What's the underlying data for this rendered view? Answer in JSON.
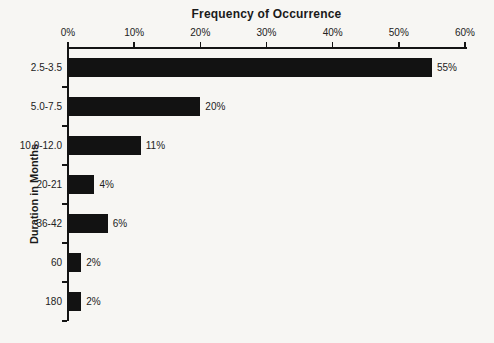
{
  "chart_data": {
    "type": "bar",
    "orientation": "horizontal",
    "title": "Frequency of Occurrence",
    "xlabel": "Frequency of Occurrence",
    "ylabel": "Duration in Months",
    "categories": [
      "2.5-3.5",
      "5.0-7.5",
      "10.0-12.0",
      "20-21",
      "36-42",
      "60",
      "180"
    ],
    "values": [
      55,
      20,
      11,
      4,
      6,
      2,
      2
    ],
    "value_labels": [
      "55%",
      "20%",
      "11%",
      "4%",
      "6%",
      "2%",
      "2%"
    ],
    "x_ticks": [
      0,
      10,
      20,
      30,
      40,
      50,
      60
    ],
    "x_tick_labels": [
      "0%",
      "10%",
      "20%",
      "30%",
      "40%",
      "50%",
      "60%"
    ],
    "xlim": [
      0,
      60
    ],
    "axis_position": "top",
    "grid": false,
    "legend": false,
    "bar_color": "#121212",
    "background_color": "#f7f6f3",
    "text_color": "#222222"
  }
}
